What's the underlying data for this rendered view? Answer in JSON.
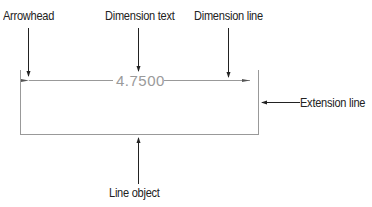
{
  "labels": {
    "arrowhead": "Arrowhead",
    "dimension_text": "Dimension text",
    "dimension_line": "Dimension line",
    "extension_line": "Extension line",
    "line_object": "Line object"
  },
  "dimension": {
    "value": "4.7500"
  },
  "colors": {
    "drawing": "#999999",
    "callout": "#222222",
    "dim_text": "#9a9a9a"
  }
}
